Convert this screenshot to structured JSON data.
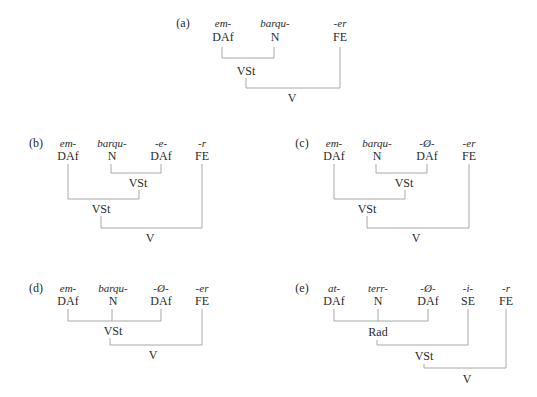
{
  "panels": {
    "a": {
      "label": "(a)",
      "morphs": [
        "em-",
        "barqu-",
        "-er"
      ],
      "cats": [
        "DAf",
        "N",
        "FE"
      ],
      "nodes": [
        "VSt",
        "V"
      ]
    },
    "b": {
      "label": "(b)",
      "morphs": [
        "em-",
        "barqu-",
        "-e-",
        "-r"
      ],
      "cats": [
        "DAf",
        "N",
        "DAf",
        "FE"
      ],
      "nodes": [
        "VSt",
        "VSt",
        "V"
      ]
    },
    "c": {
      "label": "(c)",
      "morphs": [
        "em-",
        "barqu-",
        "-Ø-",
        "-er"
      ],
      "cats": [
        "DAf",
        "N",
        "DAf",
        "FE"
      ],
      "nodes": [
        "VSt",
        "VSt",
        "V"
      ]
    },
    "d": {
      "label": "(d)",
      "morphs": [
        "em-",
        "barqu-",
        "-Ø-",
        "-er"
      ],
      "cats": [
        "DAf",
        "N",
        "DAf",
        "FE"
      ],
      "nodes": [
        "VSt",
        "V"
      ]
    },
    "e": {
      "label": "(e)",
      "morphs": [
        "at-",
        "terr-",
        "-Ø-",
        "-i-",
        "-r"
      ],
      "cats": [
        "DAf",
        "N",
        "DAf",
        "SE",
        "FE"
      ],
      "nodes": [
        "Rad",
        "VSt",
        "V"
      ]
    }
  },
  "colors": {
    "line": "#a8a8a8",
    "text": "#2a2a2a"
  }
}
